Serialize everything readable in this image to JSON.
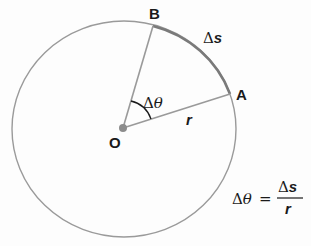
{
  "diagram": {
    "points": {
      "center": "O",
      "a": "A",
      "b": "B"
    },
    "labels": {
      "arc": "Δs",
      "arc_delta": "Δ",
      "arc_var": "s",
      "angle_delta": "Δ",
      "angle_var": "θ",
      "radius": "r"
    },
    "formula": {
      "lhs_delta": "Δ",
      "lhs_var": "θ",
      "equals": "=",
      "numerator_delta": "Δ",
      "numerator_var": "s",
      "denominator": "r",
      "text": "Δθ = Δs / r"
    },
    "colors": {
      "circle": "#9a9a9a",
      "radius_lines": "#9a9a9a",
      "arc_highlight": "#7a7a7a",
      "center_dot": "#8c8c8c",
      "text": "#1a1a1a"
    }
  }
}
